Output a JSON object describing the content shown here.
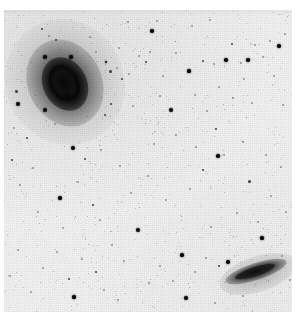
{
  "image": {
    "kind": "astronomical-sky-survey-cutout",
    "rendering": "inverted-grayscale",
    "width": 303,
    "height": 319,
    "background_color": "#f3f3f3",
    "source_color": "#0a0a0a",
    "frame": {
      "left": 4,
      "top": 10,
      "width": 288,
      "height": 302
    },
    "top_scan_strip_visible": true
  },
  "objects": [
    {
      "name": "main-spiral-galaxy",
      "type": "spiral-galaxy",
      "position_label": "upper-left",
      "center_x": 62,
      "center_y": 74,
      "core_semi_major": 18,
      "core_semi_minor": 13,
      "halo_semi_major": 64,
      "halo_semi_minor": 59,
      "position_angle_deg": -27,
      "peak_color": "#070707"
    },
    {
      "name": "edge-on-galaxy",
      "type": "edge-on-spiral-galaxy",
      "position_label": "lower-right",
      "center_x": 251,
      "center_y": 271,
      "core_semi_major": 21,
      "core_semi_minor": 4,
      "halo_semi_major": 40,
      "halo_semi_minor": 18,
      "position_angle_deg": -18,
      "peak_color": "#0c0c0c"
    }
  ],
  "stars": [
    {
      "x": 18,
      "y": 104,
      "r": 2.2,
      "mag": "bright"
    },
    {
      "x": 42,
      "y": 29,
      "r": 1.1,
      "mag": "mid"
    },
    {
      "x": 45,
      "y": 57,
      "r": 1.8,
      "mag": "bright"
    },
    {
      "x": 49,
      "y": 36,
      "r": 0.9,
      "mag": "faint"
    },
    {
      "x": 56,
      "y": 40,
      "r": 1.0,
      "mag": "mid"
    },
    {
      "x": 71,
      "y": 57,
      "r": 1.6,
      "mag": "bright"
    },
    {
      "x": 67,
      "y": 95,
      "r": 1.7,
      "mag": "bright"
    },
    {
      "x": 45,
      "y": 110,
      "r": 1.9,
      "mag": "bright"
    },
    {
      "x": 16,
      "y": 91,
      "r": 1.5,
      "mag": "mid"
    },
    {
      "x": 14,
      "y": 128,
      "r": 1.0,
      "mag": "faint"
    },
    {
      "x": 27,
      "y": 138,
      "r": 1.1,
      "mag": "mid"
    },
    {
      "x": 12,
      "y": 160,
      "r": 1.2,
      "mag": "mid"
    },
    {
      "x": 33,
      "y": 168,
      "r": 1.0,
      "mag": "faint"
    },
    {
      "x": 20,
      "y": 185,
      "r": 0.9,
      "mag": "faint"
    },
    {
      "x": 55,
      "y": 124,
      "r": 1.0,
      "mag": "faint"
    },
    {
      "x": 73,
      "y": 148,
      "r": 1.9,
      "mag": "bright"
    },
    {
      "x": 60,
      "y": 198,
      "r": 1.6,
      "mag": "bright"
    },
    {
      "x": 85,
      "y": 159,
      "r": 1.0,
      "mag": "mid"
    },
    {
      "x": 78,
      "y": 182,
      "r": 0.9,
      "mag": "faint"
    },
    {
      "x": 93,
      "y": 205,
      "r": 1.2,
      "mag": "mid"
    },
    {
      "x": 101,
      "y": 150,
      "r": 1.0,
      "mag": "faint"
    },
    {
      "x": 105,
      "y": 115,
      "r": 1.0,
      "mag": "mid"
    },
    {
      "x": 88,
      "y": 112,
      "r": 0.9,
      "mag": "faint"
    },
    {
      "x": 110,
      "y": 71,
      "r": 1.5,
      "mag": "mid"
    },
    {
      "x": 117,
      "y": 68,
      "r": 1.0,
      "mag": "faint"
    },
    {
      "x": 122,
      "y": 79,
      "r": 1.1,
      "mag": "mid"
    },
    {
      "x": 129,
      "y": 74,
      "r": 1.0,
      "mag": "faint"
    },
    {
      "x": 111,
      "y": 104,
      "r": 1.1,
      "mag": "mid"
    },
    {
      "x": 106,
      "y": 62,
      "r": 1.4,
      "mag": "bright"
    },
    {
      "x": 96,
      "y": 52,
      "r": 1.0,
      "mag": "faint"
    },
    {
      "x": 119,
      "y": 48,
      "r": 1.0,
      "mag": "faint"
    },
    {
      "x": 133,
      "y": 106,
      "r": 1.0,
      "mag": "faint"
    },
    {
      "x": 139,
      "y": 56,
      "r": 1.0,
      "mag": "faint"
    },
    {
      "x": 146,
      "y": 62,
      "r": 1.1,
      "mag": "mid"
    },
    {
      "x": 152,
      "y": 31,
      "r": 1.7,
      "mag": "bright"
    },
    {
      "x": 150,
      "y": 52,
      "r": 0.9,
      "mag": "faint"
    },
    {
      "x": 163,
      "y": 76,
      "r": 1.0,
      "mag": "faint"
    },
    {
      "x": 171,
      "y": 110,
      "r": 2.0,
      "mag": "bright"
    },
    {
      "x": 160,
      "y": 96,
      "r": 0.9,
      "mag": "faint"
    },
    {
      "x": 176,
      "y": 53,
      "r": 1.0,
      "mag": "faint"
    },
    {
      "x": 189,
      "y": 71,
      "r": 1.6,
      "mag": "bright"
    },
    {
      "x": 195,
      "y": 95,
      "r": 1.0,
      "mag": "faint"
    },
    {
      "x": 203,
      "y": 61,
      "r": 1.0,
      "mag": "mid"
    },
    {
      "x": 207,
      "y": 111,
      "r": 1.0,
      "mag": "faint"
    },
    {
      "x": 214,
      "y": 64,
      "r": 1.0,
      "mag": "faint"
    },
    {
      "x": 219,
      "y": 87,
      "r": 1.0,
      "mag": "faint"
    },
    {
      "x": 226,
      "y": 60,
      "r": 1.7,
      "mag": "bright"
    },
    {
      "x": 232,
      "y": 44,
      "r": 1.4,
      "mag": "mid"
    },
    {
      "x": 241,
      "y": 63,
      "r": 1.0,
      "mag": "faint"
    },
    {
      "x": 248,
      "y": 60,
      "r": 1.8,
      "mag": "bright"
    },
    {
      "x": 244,
      "y": 79,
      "r": 1.0,
      "mag": "faint"
    },
    {
      "x": 255,
      "y": 45,
      "r": 1.0,
      "mag": "faint"
    },
    {
      "x": 263,
      "y": 57,
      "r": 1.0,
      "mag": "faint"
    },
    {
      "x": 270,
      "y": 41,
      "r": 1.0,
      "mag": "faint"
    },
    {
      "x": 279,
      "y": 46,
      "r": 1.8,
      "mag": "bright"
    },
    {
      "x": 285,
      "y": 34,
      "r": 1.0,
      "mag": "faint"
    },
    {
      "x": 274,
      "y": 76,
      "r": 1.0,
      "mag": "faint"
    },
    {
      "x": 283,
      "y": 105,
      "r": 1.0,
      "mag": "faint"
    },
    {
      "x": 252,
      "y": 103,
      "r": 1.0,
      "mag": "faint"
    },
    {
      "x": 233,
      "y": 98,
      "r": 1.0,
      "mag": "faint"
    },
    {
      "x": 216,
      "y": 129,
      "r": 1.4,
      "mag": "mid"
    },
    {
      "x": 224,
      "y": 155,
      "r": 1.0,
      "mag": "faint"
    },
    {
      "x": 196,
      "y": 147,
      "r": 1.0,
      "mag": "faint"
    },
    {
      "x": 203,
      "y": 170,
      "r": 1.2,
      "mag": "mid"
    },
    {
      "x": 190,
      "y": 189,
      "r": 1.0,
      "mag": "faint"
    },
    {
      "x": 218,
      "y": 156,
      "r": 1.7,
      "mag": "bright"
    },
    {
      "x": 243,
      "y": 142,
      "r": 1.0,
      "mag": "faint"
    },
    {
      "x": 249,
      "y": 181,
      "r": 1.5,
      "mag": "mid"
    },
    {
      "x": 266,
      "y": 155,
      "r": 1.0,
      "mag": "faint"
    },
    {
      "x": 271,
      "y": 196,
      "r": 1.0,
      "mag": "faint"
    },
    {
      "x": 281,
      "y": 167,
      "r": 1.0,
      "mag": "faint"
    },
    {
      "x": 286,
      "y": 212,
      "r": 1.0,
      "mag": "faint"
    },
    {
      "x": 258,
      "y": 222,
      "r": 1.0,
      "mag": "faint"
    },
    {
      "x": 262,
      "y": 238,
      "r": 1.6,
      "mag": "bright"
    },
    {
      "x": 237,
      "y": 213,
      "r": 1.0,
      "mag": "faint"
    },
    {
      "x": 211,
      "y": 227,
      "r": 1.0,
      "mag": "faint"
    },
    {
      "x": 228,
      "y": 262,
      "r": 1.8,
      "mag": "bright"
    },
    {
      "x": 219,
      "y": 266,
      "r": 1.0,
      "mag": "mid"
    },
    {
      "x": 206,
      "y": 258,
      "r": 1.0,
      "mag": "faint"
    },
    {
      "x": 195,
      "y": 272,
      "r": 1.0,
      "mag": "faint"
    },
    {
      "x": 182,
      "y": 255,
      "r": 1.6,
      "mag": "bright"
    },
    {
      "x": 173,
      "y": 281,
      "r": 1.0,
      "mag": "faint"
    },
    {
      "x": 160,
      "y": 266,
      "r": 1.0,
      "mag": "faint"
    },
    {
      "x": 149,
      "y": 283,
      "r": 1.0,
      "mag": "faint"
    },
    {
      "x": 138,
      "y": 230,
      "r": 2.4,
      "mag": "bright"
    },
    {
      "x": 124,
      "y": 261,
      "r": 1.0,
      "mag": "faint"
    },
    {
      "x": 112,
      "y": 245,
      "r": 1.0,
      "mag": "faint"
    },
    {
      "x": 96,
      "y": 272,
      "r": 1.1,
      "mag": "mid"
    },
    {
      "x": 104,
      "y": 290,
      "r": 1.0,
      "mag": "faint"
    },
    {
      "x": 82,
      "y": 259,
      "r": 1.0,
      "mag": "faint"
    },
    {
      "x": 69,
      "y": 279,
      "r": 1.2,
      "mag": "mid"
    },
    {
      "x": 57,
      "y": 252,
      "r": 1.0,
      "mag": "faint"
    },
    {
      "x": 43,
      "y": 268,
      "r": 1.0,
      "mag": "faint"
    },
    {
      "x": 31,
      "y": 292,
      "r": 1.0,
      "mag": "faint"
    },
    {
      "x": 18,
      "y": 250,
      "r": 1.0,
      "mag": "faint"
    },
    {
      "x": 10,
      "y": 276,
      "r": 1.0,
      "mag": "faint"
    },
    {
      "x": 74,
      "y": 297,
      "r": 1.6,
      "mag": "bright"
    },
    {
      "x": 118,
      "y": 300,
      "r": 1.0,
      "mag": "faint"
    },
    {
      "x": 186,
      "y": 298,
      "r": 1.7,
      "mag": "bright"
    },
    {
      "x": 215,
      "y": 303,
      "r": 1.0,
      "mag": "faint"
    },
    {
      "x": 243,
      "y": 296,
      "r": 1.0,
      "mag": "faint"
    },
    {
      "x": 166,
      "y": 200,
      "r": 1.0,
      "mag": "faint"
    },
    {
      "x": 148,
      "y": 176,
      "r": 1.0,
      "mag": "faint"
    },
    {
      "x": 131,
      "y": 193,
      "r": 1.0,
      "mag": "faint"
    },
    {
      "x": 120,
      "y": 166,
      "r": 1.0,
      "mag": "faint"
    },
    {
      "x": 154,
      "y": 144,
      "r": 1.0,
      "mag": "faint"
    },
    {
      "x": 176,
      "y": 135,
      "r": 1.0,
      "mag": "faint"
    },
    {
      "x": 90,
      "y": 37,
      "r": 1.0,
      "mag": "faint"
    },
    {
      "x": 157,
      "y": 21,
      "r": 1.0,
      "mag": "faint"
    },
    {
      "x": 192,
      "y": 26,
      "r": 1.0,
      "mag": "faint"
    },
    {
      "x": 210,
      "y": 20,
      "r": 1.0,
      "mag": "faint"
    },
    {
      "x": 128,
      "y": 22,
      "r": 1.0,
      "mag": "faint"
    },
    {
      "x": 100,
      "y": 220,
      "r": 1.0,
      "mag": "faint"
    },
    {
      "x": 63,
      "y": 228,
      "r": 1.0,
      "mag": "faint"
    },
    {
      "x": 38,
      "y": 212,
      "r": 1.0,
      "mag": "faint"
    },
    {
      "x": 282,
      "y": 256,
      "r": 1.0,
      "mag": "faint"
    },
    {
      "x": 290,
      "y": 280,
      "r": 1.0,
      "mag": "faint"
    }
  ]
}
